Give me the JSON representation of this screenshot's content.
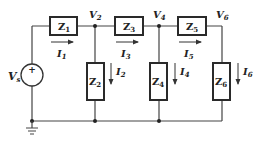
{
  "diagram": {
    "type": "ladder circuit",
    "colors": {
      "wire": "#444444",
      "box": "#2a2a2a",
      "text": "#222222",
      "background": "#ffffff"
    },
    "source": {
      "label": "V",
      "sub": "s",
      "polarity": "+"
    },
    "nodes": [
      {
        "label": "V",
        "sub": "2"
      },
      {
        "label": "V",
        "sub": "4"
      },
      {
        "label": "V",
        "sub": "6"
      }
    ],
    "series_impedances": [
      {
        "label": "Z",
        "sub": "1",
        "current": {
          "label": "I",
          "sub": "1"
        }
      },
      {
        "label": "Z",
        "sub": "3",
        "current": {
          "label": "I",
          "sub": "3"
        }
      },
      {
        "label": "Z",
        "sub": "5",
        "current": {
          "label": "I",
          "sub": "5"
        }
      }
    ],
    "shunt_impedances": [
      {
        "label": "Z",
        "sub": "2",
        "current": {
          "label": "I",
          "sub": "2"
        }
      },
      {
        "label": "Z",
        "sub": "4",
        "current": {
          "label": "I",
          "sub": "4"
        }
      },
      {
        "label": "Z",
        "sub": "6",
        "current": {
          "label": "I",
          "sub": "6"
        }
      }
    ],
    "ground_icon": "ground-icon"
  }
}
